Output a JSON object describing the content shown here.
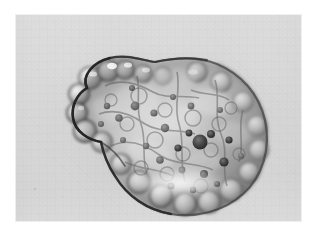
{
  "plate": {
    "name": "microscopy-plate",
    "background_color": "#ffffff",
    "field_color": "#d8d8d8",
    "field_rect": {
      "x": 15,
      "y": 14,
      "width": 287,
      "height": 208
    },
    "margin_px": 15,
    "caption": ""
  },
  "image": {
    "subject": "blebbing cell",
    "modality": "brightfield light micrograph",
    "description": "Single rounded cell with numerous surface blebs and a granular, vacuolated cytoplasm, imaged on a uniform gray background.",
    "orientation": "upper-left lobe, larger lower-right body"
  },
  "colors": {
    "page_white": "#ffffff",
    "field_gray": "#d8d8d8",
    "field_gray_dark": "#c6c6c6",
    "cell_mid": "#9a9a9a",
    "cell_light": "#e8e8e8",
    "cell_highlight": "#fdfdfd",
    "membrane_dark": "#3a3a3a",
    "membrane_darkest": "#1c1c1c",
    "granule_dark": "#2e2e2e",
    "halo_white": "#ffffff"
  },
  "cell": {
    "bounds": {
      "x": 58,
      "y": 48,
      "width": 196,
      "height": 154
    },
    "centroid": {
      "x": 156,
      "y": 126
    },
    "outline_label": "cell-membrane-outline",
    "lobes": [
      {
        "name": "upper-left-lobe",
        "cx": 96,
        "cy": 86,
        "rx": 42,
        "ry": 34
      },
      {
        "name": "lower-right-body",
        "cx": 176,
        "cy": 136,
        "rx": 78,
        "ry": 66
      }
    ],
    "blebs": [
      {
        "cx": 75,
        "cy": 64,
        "r": 11
      },
      {
        "cx": 93,
        "cy": 57,
        "r": 10
      },
      {
        "cx": 110,
        "cy": 56,
        "r": 9
      },
      {
        "cx": 64,
        "cy": 80,
        "r": 10
      },
      {
        "cx": 62,
        "cy": 99,
        "r": 10
      },
      {
        "cx": 70,
        "cy": 117,
        "r": 11
      },
      {
        "cx": 87,
        "cy": 128,
        "r": 10
      },
      {
        "cx": 128,
        "cy": 60,
        "r": 9
      },
      {
        "cx": 148,
        "cy": 62,
        "r": 9
      },
      {
        "cx": 106,
        "cy": 150,
        "r": 10
      },
      {
        "cx": 124,
        "cy": 168,
        "r": 11
      },
      {
        "cx": 146,
        "cy": 182,
        "r": 11
      },
      {
        "cx": 170,
        "cy": 190,
        "r": 11
      },
      {
        "cx": 194,
        "cy": 188,
        "r": 11
      },
      {
        "cx": 216,
        "cy": 176,
        "r": 11
      },
      {
        "cx": 234,
        "cy": 158,
        "r": 10
      },
      {
        "cx": 244,
        "cy": 136,
        "r": 10
      },
      {
        "cx": 242,
        "cy": 112,
        "r": 10
      },
      {
        "cx": 228,
        "cy": 88,
        "r": 10
      },
      {
        "cx": 206,
        "cy": 68,
        "r": 10
      },
      {
        "cx": 182,
        "cy": 58,
        "r": 10
      }
    ],
    "granules": [
      {
        "cx": 185,
        "cy": 128,
        "r": 7.5,
        "tone": "darkest"
      },
      {
        "cx": 196,
        "cy": 120,
        "r": 4.0,
        "tone": "dark"
      },
      {
        "cx": 174,
        "cy": 119,
        "r": 3.4,
        "tone": "dark"
      },
      {
        "cx": 163,
        "cy": 134,
        "r": 3.6,
        "tone": "dark"
      },
      {
        "cx": 150,
        "cy": 114,
        "r": 4.2,
        "tone": "mid"
      },
      {
        "cx": 139,
        "cy": 99,
        "r": 3.6,
        "tone": "mid"
      },
      {
        "cx": 120,
        "cy": 92,
        "r": 4.4,
        "tone": "mid"
      },
      {
        "cx": 104,
        "cy": 104,
        "r": 3.8,
        "tone": "mid"
      },
      {
        "cx": 92,
        "cy": 92,
        "r": 3.2,
        "tone": "mid"
      },
      {
        "cx": 117,
        "cy": 74,
        "r": 3.0,
        "tone": "mid"
      },
      {
        "cx": 158,
        "cy": 83,
        "r": 3.0,
        "tone": "mid"
      },
      {
        "cx": 176,
        "cy": 92,
        "r": 3.4,
        "tone": "mid"
      },
      {
        "cx": 205,
        "cy": 96,
        "r": 3.0,
        "tone": "mid"
      },
      {
        "cx": 214,
        "cy": 126,
        "r": 3.6,
        "tone": "dark"
      },
      {
        "cx": 209,
        "cy": 148,
        "r": 4.6,
        "tone": "dark"
      },
      {
        "cx": 189,
        "cy": 160,
        "r": 4.0,
        "tone": "dark"
      },
      {
        "cx": 167,
        "cy": 156,
        "r": 3.4,
        "tone": "mid"
      },
      {
        "cx": 145,
        "cy": 146,
        "r": 3.8,
        "tone": "mid"
      },
      {
        "cx": 131,
        "cy": 132,
        "r": 3.2,
        "tone": "mid"
      },
      {
        "cx": 156,
        "cy": 172,
        "r": 3.6,
        "tone": "dark"
      },
      {
        "cx": 178,
        "cy": 176,
        "r": 3.2,
        "tone": "dark"
      },
      {
        "cx": 202,
        "cy": 170,
        "r": 3.0,
        "tone": "dark"
      },
      {
        "cx": 226,
        "cy": 142,
        "r": 3.0,
        "tone": "mid"
      },
      {
        "cx": 108,
        "cy": 126,
        "r": 3.0,
        "tone": "mid"
      },
      {
        "cx": 86,
        "cy": 110,
        "r": 3.0,
        "tone": "mid"
      }
    ],
    "halo": {
      "name": "diffraction-halo",
      "bright_rect": {
        "x": 96,
        "y": 150,
        "width": 138,
        "height": 42
      },
      "dark_rect": {
        "x": 40,
        "y": 28,
        "width": 216,
        "height": 168
      }
    }
  },
  "specks": [
    {
      "x": 34,
      "y": 188,
      "size": 2
    },
    {
      "x": 244,
      "y": 22,
      "size": 1
    },
    {
      "x": 62,
      "y": 196,
      "size": 1
    }
  ]
}
